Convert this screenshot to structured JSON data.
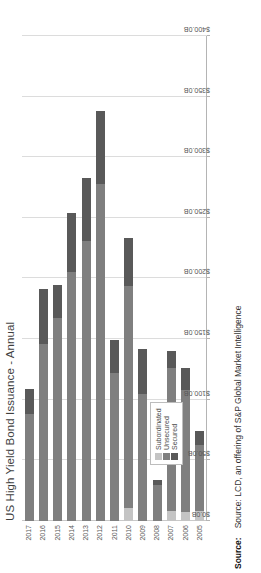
{
  "chart_data": {
    "type": "bar",
    "orientation": "horizontal",
    "stacked": true,
    "title": "US High Yield Bond Issuance - Annual",
    "xlabel": "",
    "ylabel": "",
    "categories": [
      "2005",
      "2006",
      "2007",
      "2008",
      "2009",
      "2010",
      "2011",
      "2012",
      "2013",
      "2014",
      "2015",
      "2016",
      "2017"
    ],
    "series": [
      {
        "name": "Secured",
        "color": "#595959",
        "values": [
          11.0,
          18.0,
          14.0,
          4.0,
          37.0,
          39.0,
          27.0,
          60.0,
          52.0,
          49.0,
          28.0,
          45.0,
          21.0
        ]
      },
      {
        "name": "Unsecured",
        "color": "#7f7f7f",
        "values": [
          55.0,
          101.0,
          118.0,
          30.0,
          105.0,
          183.0,
          122.0,
          278.0,
          231.0,
          205.0,
          167.0,
          146.0,
          88.0
        ]
      },
      {
        "name": "Subordinated",
        "color": "#c4c4c4",
        "values": [
          8.0,
          7.0,
          8.0,
          0.0,
          0.0,
          11.0,
          0.0,
          0.0,
          0.0,
          0.0,
          0.0,
          0.0,
          0.0
        ]
      }
    ],
    "totals": [
      74.0,
      126.0,
      140.0,
      34.0,
      142.0,
      233.0,
      149.0,
      338.0,
      283.0,
      254.0,
      195.0,
      191.0,
      109.0
    ],
    "axis_ticks": [
      "$0.0B",
      "$50.0B",
      "$100.0B",
      "$150.0B",
      "$200.0B",
      "$250.0B",
      "$300.0B",
      "$350.0B",
      "$400.0B"
    ],
    "axis_tick_values": [
      0,
      50,
      100,
      150,
      200,
      250,
      300,
      350,
      400
    ],
    "xlim": [
      0,
      400
    ],
    "grid": true,
    "legend_position": "inside-left",
    "legend_entries": [
      "Subordinated",
      "Unsecured",
      "Secured"
    ]
  },
  "legend": {
    "items": [
      {
        "label": "Subordinated",
        "color": "#c4c4c4"
      },
      {
        "label": "Unsecured",
        "color": "#7f7f7f"
      },
      {
        "label": "Secured",
        "color": "#595959"
      }
    ]
  },
  "footnote": {
    "label": "Source:",
    "text": "Source: LCD, an offering of S&P Global Market Intelligence"
  }
}
